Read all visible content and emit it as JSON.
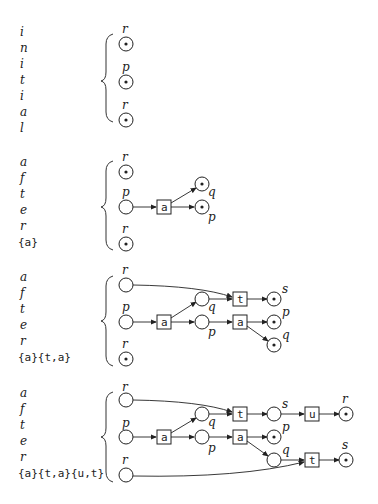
{
  "colors": {
    "ink": "#222222",
    "background": "#ffffff"
  },
  "panels": [
    {
      "id": "initial",
      "side_label_letters": [
        "i",
        "n",
        "i",
        "t",
        "i",
        "a",
        "l"
      ],
      "step_label": "",
      "places": [
        {
          "name": "r",
          "marked": true
        },
        {
          "name": "p",
          "marked": true
        },
        {
          "name": "r",
          "marked": true
        }
      ],
      "transitions": []
    },
    {
      "id": "after-a",
      "side_label_letters": [
        "a",
        "f",
        "t",
        "e",
        "r"
      ],
      "step_label": "{a}",
      "places": [
        {
          "name": "r",
          "marked": true
        },
        {
          "name": "p",
          "marked": false
        },
        {
          "name": "r",
          "marked": true
        },
        {
          "name": "q",
          "marked": true
        },
        {
          "name": "p",
          "marked": true
        }
      ],
      "transitions": [
        {
          "name": "a"
        }
      ]
    },
    {
      "id": "after-a-ta",
      "side_label_letters": [
        "a",
        "f",
        "t",
        "e",
        "r"
      ],
      "step_label": "{a}{t,a}",
      "places": [
        {
          "name": "r",
          "marked": false
        },
        {
          "name": "p",
          "marked": false
        },
        {
          "name": "r",
          "marked": true
        },
        {
          "name": "q",
          "marked": false
        },
        {
          "name": "p",
          "marked": false
        },
        {
          "name": "s",
          "marked": true
        },
        {
          "name": "p",
          "marked": true
        },
        {
          "name": "q",
          "marked": true
        }
      ],
      "transitions": [
        {
          "name": "a"
        },
        {
          "name": "t"
        },
        {
          "name": "a"
        }
      ]
    },
    {
      "id": "after-a-ta-ut",
      "side_label_letters": [
        "a",
        "f",
        "t",
        "e",
        "r"
      ],
      "step_label": "{a}{t,a}{u,t}",
      "places": [
        {
          "name": "r",
          "marked": false
        },
        {
          "name": "p",
          "marked": false
        },
        {
          "name": "r",
          "marked": false
        },
        {
          "name": "q",
          "marked": false
        },
        {
          "name": "p",
          "marked": false
        },
        {
          "name": "s",
          "marked": false
        },
        {
          "name": "p",
          "marked": true
        },
        {
          "name": "q",
          "marked": false
        },
        {
          "name": "r",
          "marked": true
        },
        {
          "name": "s",
          "marked": true
        }
      ],
      "transitions": [
        {
          "name": "a"
        },
        {
          "name": "t"
        },
        {
          "name": "a"
        },
        {
          "name": "u"
        },
        {
          "name": "t"
        }
      ]
    }
  ],
  "text": {
    "p1": {
      "l0": "i",
      "l1": "n",
      "l2": "i",
      "l3": "t",
      "l4": "i",
      "l5": "a",
      "l6": "l",
      "r1": "r",
      "p": "p",
      "r2": "r"
    },
    "p2": {
      "l0": "a",
      "l1": "f",
      "l2": "t",
      "l3": "e",
      "l4": "r",
      "step": "{a}",
      "r1": "r",
      "p": "p",
      "r2": "r",
      "q": "q",
      "p2": "p",
      "ta": "a"
    },
    "p3": {
      "l0": "a",
      "l1": "f",
      "l2": "t",
      "l3": "e",
      "l4": "r",
      "step": "{a}{t,a}",
      "r1": "r",
      "p": "p",
      "r2": "r",
      "q": "q",
      "p2": "p",
      "s": "s",
      "p3": "p",
      "q2": "q",
      "ta": "a",
      "tt": "t",
      "ta2": "a"
    },
    "p4": {
      "l0": "a",
      "l1": "f",
      "l2": "t",
      "l3": "e",
      "l4": "r",
      "step": "{a}{t,a}{u,t}",
      "r1": "r",
      "p": "p",
      "r2": "r",
      "q": "q",
      "p2": "p",
      "s": "s",
      "p3": "p",
      "q2": "q",
      "r3": "r",
      "s2": "s",
      "ta": "a",
      "tt": "t",
      "ta2": "a",
      "tu": "u",
      "tt2": "t"
    }
  }
}
